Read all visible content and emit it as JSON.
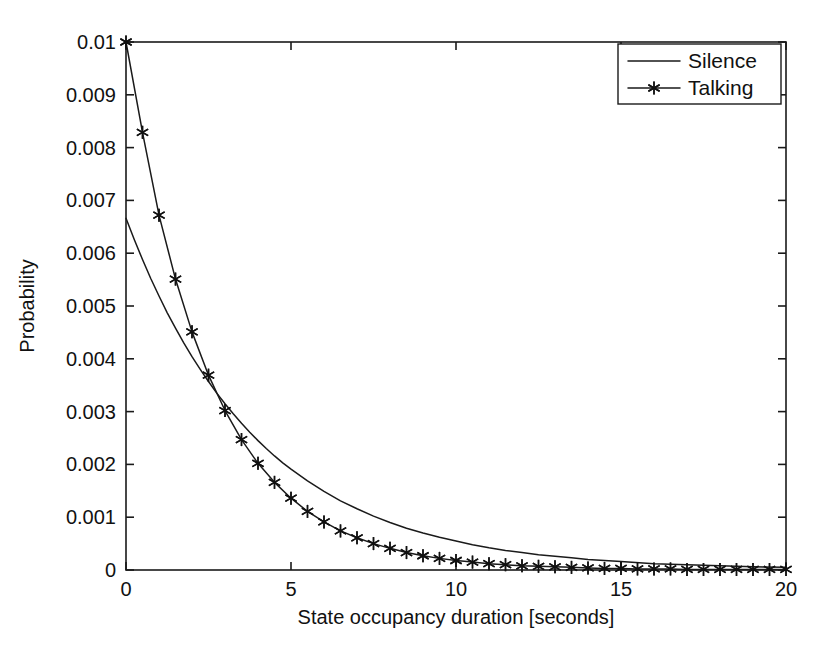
{
  "chart_data": {
    "type": "line",
    "title": "",
    "xlabel": "State occupancy duration [seconds]",
    "ylabel": "Probability",
    "xlim": [
      0,
      20
    ],
    "ylim": [
      0,
      0.01
    ],
    "grid": false,
    "legend_position": "top-right",
    "xticks": [
      0,
      5,
      10,
      15,
      20
    ],
    "xticklabels": [
      "0",
      "5",
      "10",
      "15",
      "20"
    ],
    "yticks": [
      0,
      0.001,
      0.002,
      0.003,
      0.004,
      0.005,
      0.006,
      0.007,
      0.008,
      0.009,
      0.01
    ],
    "yticklabels": [
      "0",
      "0.001",
      "0.002",
      "0.003",
      "0.004",
      "0.005",
      "0.006",
      "0.007",
      "0.008",
      "0.009",
      "0.01"
    ],
    "series": [
      {
        "name": "Silence",
        "marker": "none",
        "color": "#1a1a1a",
        "x": [
          0,
          0.25,
          0.5,
          0.75,
          1,
          1.25,
          1.5,
          1.75,
          2,
          2.25,
          2.5,
          2.75,
          3,
          3.25,
          3.5,
          3.75,
          4,
          4.25,
          4.5,
          4.75,
          5,
          5.5,
          6,
          6.5,
          7,
          7.5,
          8,
          8.5,
          9,
          9.5,
          10,
          10.5,
          11,
          11.5,
          12,
          12.5,
          13,
          13.5,
          14,
          14.5,
          15,
          16,
          17,
          18,
          19,
          20
        ],
        "y": [
          0.00666,
          0.00626,
          0.00588,
          0.00552,
          0.00519,
          0.00487,
          0.00458,
          0.0043,
          0.00404,
          0.0038,
          0.00357,
          0.00335,
          0.00315,
          0.00296,
          0.00278,
          0.00261,
          0.00245,
          0.0023,
          0.00216,
          0.00203,
          0.00191,
          0.00169,
          0.00149,
          0.00131,
          0.00116,
          0.00102,
          0.0009,
          0.00079,
          0.0007,
          0.00062,
          0.00055,
          0.00048,
          0.00042,
          0.00037,
          0.00033,
          0.00029,
          0.00026,
          0.00023,
          0.0002,
          0.00018,
          0.00016,
          0.00012,
          0.0001,
          8e-05,
          6e-05,
          5e-05
        ]
      },
      {
        "name": "Talking",
        "marker": "asterisk",
        "color": "#1a1a1a",
        "x": [
          0,
          0.5,
          1,
          1.5,
          2,
          2.5,
          3,
          3.5,
          4,
          4.5,
          5,
          5.5,
          6,
          6.5,
          7,
          7.5,
          8,
          8.5,
          9,
          9.5,
          10,
          10.5,
          11,
          11.5,
          12,
          12.5,
          13,
          13.5,
          14,
          14.5,
          15,
          15.5,
          16,
          16.5,
          17,
          17.5,
          18,
          18.5,
          19,
          19.5,
          20
        ],
        "y": [
          0.01,
          0.00829,
          0.00672,
          0.00551,
          0.00451,
          0.00369,
          0.00302,
          0.00247,
          0.00202,
          0.00166,
          0.00136,
          0.00111,
          0.00091,
          0.00074,
          0.00061,
          0.0005,
          0.00041,
          0.00033,
          0.00027,
          0.00022,
          0.00018,
          0.00015,
          0.00012,
          0.0001,
          8e-05,
          7e-05,
          6e-05,
          5e-05,
          4e-05,
          3e-05,
          3e-05,
          2e-05,
          2e-05,
          2e-05,
          1e-05,
          1e-05,
          1e-05,
          1e-05,
          1e-05,
          1e-05,
          1e-05
        ]
      }
    ]
  },
  "legend": {
    "entries": [
      {
        "label": "Silence",
        "marker": "none"
      },
      {
        "label": "Talking",
        "marker": "asterisk"
      }
    ]
  },
  "axes": {
    "x_title": "State occupancy duration [seconds]",
    "y_title": "Probability"
  }
}
